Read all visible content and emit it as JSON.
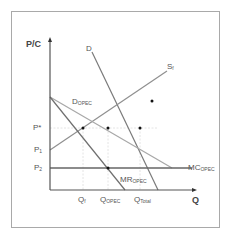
{
  "diagram": {
    "type": "economics-dominant-firm-model",
    "axes": {
      "y_label": "P/C",
      "x_label": "Q"
    },
    "price_labels": [
      {
        "id": "p_star",
        "text": "P*"
      },
      {
        "id": "p1",
        "text": "P",
        "sub": "1"
      },
      {
        "id": "p2",
        "text": "P",
        "sub": "2"
      }
    ],
    "quantity_labels": [
      {
        "id": "q_f",
        "text": "Q",
        "sub": "f"
      },
      {
        "id": "q_opec",
        "text": "Q",
        "sub": "OPEC"
      },
      {
        "id": "q_total",
        "text": "Q",
        "sub": "Total"
      }
    ],
    "curves": [
      {
        "id": "D",
        "text": "D",
        "sub": ""
      },
      {
        "id": "S_f",
        "text": "S",
        "sub": "f"
      },
      {
        "id": "D_OPEC",
        "text": "D",
        "sub": "OPEC"
      },
      {
        "id": "MR_OPEC",
        "text": "MR",
        "sub": "OPEC"
      },
      {
        "id": "MC_OPEC",
        "text": "MC",
        "sub": "OPEC"
      }
    ],
    "colors": {
      "frame": "#a9a9a9",
      "axis": "#555555",
      "curve": "#8a8a8a",
      "mc": "#666666",
      "guide": "#dddddd",
      "point": "#111111"
    }
  }
}
